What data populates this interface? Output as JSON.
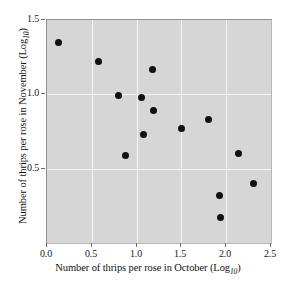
{
  "chart_data": {
    "type": "scatter",
    "title": "",
    "xlabel": "Number of thrips per rose in October (Log",
    "xlabel_sub": "10",
    "xlabel_tail": ")",
    "ylabel": "Number of thrips per rose in November (Log",
    "ylabel_sub": "10",
    "ylabel_tail": ")",
    "xlim": [
      0.0,
      2.5
    ],
    "ylim": [
      0.0,
      1.5
    ],
    "xticks": [
      "0.0",
      "0.5",
      "1.0",
      "1.5",
      "2.0",
      "2.5"
    ],
    "xtick_values": [
      0.0,
      0.5,
      1.0,
      1.5,
      2.0,
      2.5
    ],
    "yticks": [
      "0.5",
      "1.0",
      "1.5"
    ],
    "ytick_values": [
      0.5,
      1.0,
      1.5
    ],
    "grid": true,
    "gridlines_x": [
      0.5,
      1.0,
      1.5,
      2.0
    ],
    "gridlines_y": [
      0.5,
      1.0
    ],
    "legend": null,
    "plot_background_color": "#d6d6d6",
    "gridline_color": "#f4f4f4",
    "marker_color": "#111111",
    "marker_size": 7,
    "points": [
      {
        "x": 0.13,
        "y": 1.35
      },
      {
        "x": 0.57,
        "y": 1.22
      },
      {
        "x": 1.18,
        "y": 1.17
      },
      {
        "x": 0.8,
        "y": 0.99
      },
      {
        "x": 1.05,
        "y": 0.98
      },
      {
        "x": 1.19,
        "y": 0.89
      },
      {
        "x": 1.8,
        "y": 0.83
      },
      {
        "x": 1.5,
        "y": 0.77
      },
      {
        "x": 1.08,
        "y": 0.73
      },
      {
        "x": 2.14,
        "y": 0.6
      },
      {
        "x": 0.88,
        "y": 0.59
      },
      {
        "x": 2.31,
        "y": 0.4
      },
      {
        "x": 1.93,
        "y": 0.32
      },
      {
        "x": 1.94,
        "y": 0.17
      }
    ]
  }
}
